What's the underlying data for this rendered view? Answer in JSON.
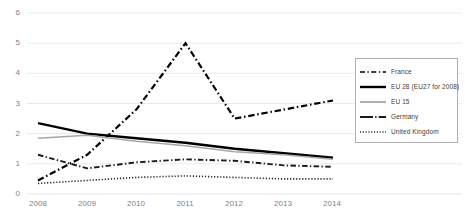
{
  "chart_data": {
    "type": "line",
    "title": "",
    "xlabel": "",
    "ylabel": "",
    "x": [
      2008,
      2009,
      2010,
      2011,
      2012,
      2013,
      2014
    ],
    "categories": [
      "2008",
      "2009",
      "2010",
      "2011",
      "2012",
      "2013",
      "2014"
    ],
    "xlim": [
      2008,
      2014
    ],
    "ylim": [
      0,
      6
    ],
    "y_ticks": [
      0,
      1,
      2,
      3,
      4,
      5,
      6
    ],
    "y_tick_labels": [
      "0",
      "1",
      "2",
      "3",
      "4",
      "5",
      "6"
    ],
    "grid": "horizontal",
    "legend_position": "right",
    "series": [
      {
        "name": "France",
        "values": [
          0.45,
          1.3,
          2.8,
          5.0,
          2.5,
          2.8,
          3.1
        ],
        "style": "dash-dot",
        "color": "#000000",
        "width": 2.2
      },
      {
        "name": "EU 28 (EU27 for 2008)",
        "values": [
          2.35,
          2.0,
          1.85,
          1.7,
          1.5,
          1.35,
          1.2
        ],
        "style": "solid",
        "color": "#000000",
        "width": 2.4
      },
      {
        "name": "EU 15",
        "values": [
          1.85,
          1.95,
          1.75,
          1.6,
          1.4,
          1.3,
          1.15
        ],
        "style": "solid",
        "color": "#a6a6a6",
        "width": 1.6
      },
      {
        "name": "Germany",
        "values": [
          1.3,
          0.85,
          1.05,
          1.15,
          1.1,
          0.95,
          0.9
        ],
        "style": "dash-dot",
        "color": "#1a1a1a",
        "width": 1.9
      },
      {
        "name": "United Kingdom",
        "values": [
          0.35,
          0.45,
          0.55,
          0.6,
          0.55,
          0.5,
          0.5
        ],
        "style": "dotted",
        "color": "#262626",
        "width": 1.6
      }
    ]
  },
  "legend": {
    "items": [
      {
        "label": "France"
      },
      {
        "label": "EU 28 (EU27 for 2008)"
      },
      {
        "label": "EU 15"
      },
      {
        "label": "Germany"
      },
      {
        "label": "United Kingdom"
      }
    ]
  },
  "axes": {
    "y_labels": [
      "6",
      "5",
      "4",
      "3",
      "2",
      "1",
      "0"
    ],
    "x_labels": [
      "2008",
      "2009",
      "2010",
      "2011",
      "2012",
      "2013",
      "2014"
    ]
  },
  "colors": {
    "grid": "#e8e8e8",
    "axis_text": "#7f7f7f",
    "legend_border": "#b0b0b0",
    "plot_background": "#ffffff"
  }
}
